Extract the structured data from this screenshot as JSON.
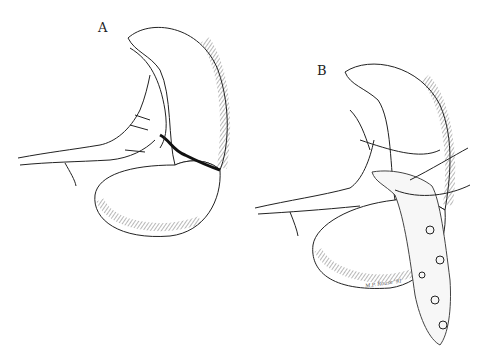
{
  "figure": {
    "panels": [
      {
        "label": "A",
        "description": "Spleen with transverse laceration across lower pole, splenic vessels at hilum"
      },
      {
        "label": "B",
        "description": "Spleen wrapped with omental pedicle/mesh and sutures at laceration site"
      }
    ],
    "signature": "M.P. Rouse '91",
    "colors": {
      "ink": "#222222",
      "background": "#ffffff"
    }
  }
}
